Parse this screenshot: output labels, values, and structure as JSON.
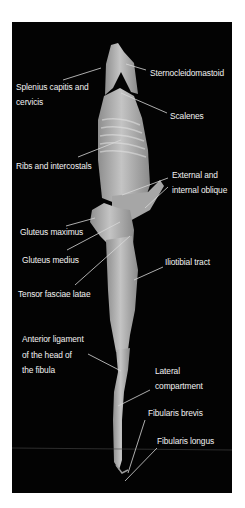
{
  "figure": {
    "background_color": "#030303",
    "label_color": "#f2f2f2",
    "leader_color": "#d8d8d8",
    "specimen_color": "#b9b9b9"
  },
  "labels": {
    "sternocleidomastoid": "Sternocleidomastoid",
    "splenius_line1": "Splenius capitis and",
    "splenius_line2": "cervicis",
    "scalenes": "Scalenes",
    "ribs": "Ribs and intercostals",
    "oblique_line1": "External and",
    "oblique_line2": "internal oblique",
    "gluteus_maximus": "Gluteus maximus",
    "gluteus_medius": "Gluteus medius",
    "iliotibial": "Iliotibial tract",
    "tensor": "Tensor fasciae latae",
    "anterior_ligament_line1": "Anterior ligament",
    "anterior_ligament_line2": "of the head of",
    "anterior_ligament_line3": "the fibula",
    "lateral_line1": "Lateral",
    "lateral_line2": "compartment",
    "fibularis_brevis": "Fibularis brevis",
    "fibularis_longus": "Fibularis longus"
  }
}
